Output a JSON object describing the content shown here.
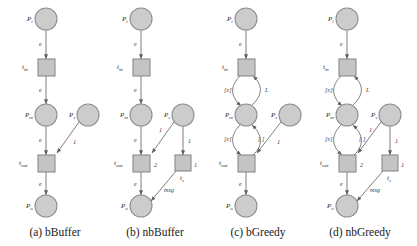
{
  "figure": {
    "width": 417,
    "height": 246,
    "background": "#ffffff",
    "place_fill": "#cccccc",
    "place_stroke": "#8f8f8f",
    "transition_fill": "#c4c4c4",
    "transition_stroke": "#8a8a8a",
    "arc_color": "#6f6f6f"
  },
  "panels": [
    {
      "id": "a",
      "caption": "(a) bBuffer",
      "caption_x": 55,
      "caption_y": 236,
      "places": [
        {
          "name": "place-pi",
          "label": "P",
          "sub": "i",
          "cx": 46,
          "cy": 19,
          "r": 11,
          "label_x": 27,
          "label_y": 21
        },
        {
          "name": "place-pm",
          "label": "P",
          "sub": "m",
          "cx": 46,
          "cy": 115,
          "r": 11,
          "label_x": 25,
          "label_y": 117
        },
        {
          "name": "place-ps",
          "label": "P",
          "sub": "s",
          "cx": 88,
          "cy": 115,
          "r": 11,
          "label_x": 69,
          "label_y": 117
        },
        {
          "name": "place-po",
          "label": "P",
          "sub": "o",
          "cx": 46,
          "cy": 206,
          "r": 11,
          "label_x": 26,
          "label_y": 208
        }
      ],
      "transitions": [
        {
          "name": "transition-tin",
          "label": "t",
          "sub": "in",
          "x": 38,
          "y": 59,
          "w": 17,
          "h": 17,
          "label_x": 22,
          "label_y": 69
        },
        {
          "name": "transition-tout",
          "label": "t",
          "sub": "out",
          "x": 38,
          "y": 155,
          "w": 17,
          "h": 17,
          "label_x": 19,
          "label_y": 165
        }
      ],
      "arcs": [
        {
          "name": "arc-pi-tin",
          "d": "M 46 30 L 46 59",
          "arrow": true,
          "label": "e",
          "label_x": 39,
          "label_y": 46
        },
        {
          "name": "arc-tin-pm",
          "d": "M 46 76 L 46 104",
          "arrow": true,
          "label": "e",
          "label_x": 39,
          "label_y": 92
        },
        {
          "name": "arc-pm-tout",
          "d": "M 46 126 L 46 155",
          "arrow": true,
          "label": "e",
          "label_x": 39,
          "label_y": 142
        },
        {
          "name": "arc-ps-tout",
          "d": "M 79 122 L 57 153",
          "arrow": true,
          "label": "1",
          "label_x": 73,
          "label_y": 144
        },
        {
          "name": "arc-tout-po",
          "d": "M 46 172 L 46 195",
          "arrow": true,
          "label": "e",
          "label_x": 39,
          "label_y": 186
        }
      ]
    },
    {
      "id": "b",
      "caption": "(b) nbBuffer",
      "caption_x": 155,
      "caption_y": 236,
      "places": [
        {
          "name": "place-pi",
          "label": "P",
          "sub": "i",
          "cx": 141,
          "cy": 19,
          "r": 11,
          "label_x": 122,
          "label_y": 21
        },
        {
          "name": "place-pm",
          "label": "P",
          "sub": "m",
          "cx": 141,
          "cy": 115,
          "r": 11,
          "label_x": 120,
          "label_y": 117
        },
        {
          "name": "place-ps",
          "label": "P",
          "sub": "s",
          "cx": 183,
          "cy": 115,
          "r": 11,
          "label_x": 164,
          "label_y": 117
        },
        {
          "name": "place-po",
          "label": "P",
          "sub": "o",
          "cx": 141,
          "cy": 206,
          "r": 11,
          "label_x": 121,
          "label_y": 208
        }
      ],
      "transitions": [
        {
          "name": "transition-tin",
          "label": "t",
          "sub": "in",
          "x": 133,
          "y": 59,
          "w": 17,
          "h": 17,
          "label_x": 117,
          "label_y": 69
        },
        {
          "name": "transition-tout",
          "label": "t",
          "sub": "out",
          "x": 133,
          "y": 155,
          "w": 17,
          "h": 17,
          "label_x": 114,
          "label_y": 165
        },
        {
          "name": "transition-ts",
          "label": "t",
          "sub": "s",
          "x": 175,
          "y": 155,
          "w": 16,
          "h": 16,
          "label_x": 180,
          "label_y": 180
        }
      ],
      "arcs": [
        {
          "name": "arc-pi-tin",
          "d": "M 141 30 L 141 59",
          "arrow": true,
          "label": "e",
          "label_x": 134,
          "label_y": 46
        },
        {
          "name": "arc-tin-pm",
          "d": "M 141 76 L 141 104",
          "arrow": true,
          "label": "e",
          "label_x": 134,
          "label_y": 92
        },
        {
          "name": "arc-pm-tout",
          "d": "M 141 126 L 141 155",
          "arrow": true,
          "label": "e",
          "label_x": 134,
          "label_y": 142
        },
        {
          "name": "arc-ps-tout",
          "d": "M 174 122 L 152 153",
          "arrow": true,
          "label": "1",
          "label_x": 159,
          "label_y": 132
        },
        {
          "name": "arc-ps-ts",
          "d": "M 183 126 L 183 155",
          "arrow": true,
          "label": "1",
          "label_x": 188,
          "label_y": 143
        },
        {
          "name": "arc-tout-po",
          "d": "M 141 172 L 141 195",
          "arrow": true,
          "label": "e",
          "label_x": 134,
          "label_y": 186
        },
        {
          "name": "arc-ts-po",
          "d": "M 176 171 L 151 201",
          "arrow": true,
          "label": "msg",
          "label_x": 164,
          "label_y": 192
        }
      ],
      "weights": [
        {
          "name": "weight-tout",
          "label": "2",
          "x": 154,
          "y": 167
        },
        {
          "name": "weight-ts",
          "label": "1",
          "x": 194,
          "y": 167
        }
      ]
    },
    {
      "id": "c",
      "caption": "(c) bGreedy",
      "caption_x": 258,
      "caption_y": 236,
      "places": [
        {
          "name": "place-pi",
          "label": "P",
          "sub": "i",
          "cx": 246,
          "cy": 19,
          "r": 11,
          "label_x": 227,
          "label_y": 21
        },
        {
          "name": "place-pm",
          "label": "P",
          "sub": "m",
          "cx": 246,
          "cy": 115,
          "r": 11,
          "label_x": 225,
          "label_y": 117
        },
        {
          "name": "place-ps",
          "label": "P",
          "sub": "s",
          "cx": 290,
          "cy": 115,
          "r": 11,
          "label_x": 271,
          "label_y": 117
        },
        {
          "name": "place-po",
          "label": "P",
          "sub": "o",
          "cx": 246,
          "cy": 206,
          "r": 11,
          "label_x": 226,
          "label_y": 208
        }
      ],
      "transitions": [
        {
          "name": "transition-tin",
          "label": "t",
          "sub": "in",
          "x": 238,
          "y": 59,
          "w": 17,
          "h": 17,
          "label_x": 222,
          "label_y": 69
        },
        {
          "name": "transition-tout",
          "label": "t",
          "sub": "out",
          "x": 238,
          "y": 155,
          "w": 17,
          "h": 17,
          "label_x": 219,
          "label_y": 165
        }
      ],
      "arcs": [
        {
          "name": "arc-pi-tin",
          "d": "M 246 30 L 246 59",
          "arrow": true,
          "label": "e",
          "label_x": 239,
          "label_y": 46
        },
        {
          "name": "arc-tin-pm-left",
          "d": "M 240 76 C 230 86 230 96 241 106",
          "arrow": true,
          "label": "[e]",
          "label_x": 224,
          "label_y": 92
        },
        {
          "name": "arc-pm-tin-right",
          "d": "M 252 105 C 263 95 263 85 253 76",
          "arrow": true,
          "label": "L",
          "label_x": 265,
          "label_y": 92
        },
        {
          "name": "arc-pm-tout-left",
          "d": "M 240 125 C 230 135 230 146 241 155",
          "arrow": true,
          "label": "[e]",
          "label_x": 224,
          "label_y": 141
        },
        {
          "name": "arc-tout-pm-right",
          "d": "M 253 155 C 263 146 263 135 252 125",
          "arrow": true,
          "label": "[ ]",
          "label_x": 258,
          "label_y": 141
        },
        {
          "name": "arc-ps-tout",
          "d": "M 281 122 L 257 153",
          "arrow": true,
          "label": "1",
          "label_x": 277,
          "label_y": 144
        },
        {
          "name": "arc-tout-po",
          "d": "M 246 172 L 246 195",
          "arrow": true,
          "label": "e",
          "label_x": 239,
          "label_y": 186
        }
      ]
    },
    {
      "id": "d",
      "caption": "(d) nbGreedy",
      "caption_x": 360,
      "caption_y": 236,
      "places": [
        {
          "name": "place-pi",
          "label": "P",
          "sub": "i",
          "cx": 347,
          "cy": 19,
          "r": 11,
          "label_x": 328,
          "label_y": 21
        },
        {
          "name": "place-pm",
          "label": "P",
          "sub": "m",
          "cx": 347,
          "cy": 115,
          "r": 11,
          "label_x": 326,
          "label_y": 117
        },
        {
          "name": "place-ps",
          "label": "P",
          "sub": "s",
          "cx": 390,
          "cy": 115,
          "r": 11,
          "label_x": 371,
          "label_y": 117
        },
        {
          "name": "place-po",
          "label": "P",
          "sub": "o",
          "cx": 347,
          "cy": 206,
          "r": 11,
          "label_x": 327,
          "label_y": 208
        }
      ],
      "transitions": [
        {
          "name": "transition-tin",
          "label": "t",
          "sub": "in",
          "x": 339,
          "y": 59,
          "w": 17,
          "h": 17,
          "label_x": 323,
          "label_y": 69
        },
        {
          "name": "transition-tout",
          "label": "t",
          "sub": "out",
          "x": 339,
          "y": 155,
          "w": 17,
          "h": 17,
          "label_x": 320,
          "label_y": 165
        },
        {
          "name": "transition-ts",
          "label": "t",
          "sub": "s",
          "x": 382,
          "y": 155,
          "w": 16,
          "h": 16,
          "label_x": 387,
          "label_y": 180
        }
      ],
      "arcs": [
        {
          "name": "arc-pi-tin",
          "d": "M 347 30 L 347 59",
          "arrow": true,
          "label": "e",
          "label_x": 340,
          "label_y": 46
        },
        {
          "name": "arc-tin-pm-left",
          "d": "M 341 76 C 331 86 331 96 342 106",
          "arrow": true,
          "label": "[e]",
          "label_x": 325,
          "label_y": 92
        },
        {
          "name": "arc-pm-tin-right",
          "d": "M 353 105 C 364 95 364 85 354 76",
          "arrow": true,
          "label": "L",
          "label_x": 366,
          "label_y": 92
        },
        {
          "name": "arc-pm-tout-left",
          "d": "M 341 125 C 331 135 331 146 342 155",
          "arrow": true,
          "label": "[e]",
          "label_x": 325,
          "label_y": 141
        },
        {
          "name": "arc-tout-pm-right",
          "d": "M 354 155 C 364 146 364 135 353 125",
          "arrow": true,
          "label": "[ ]",
          "label_x": 359,
          "label_y": 141
        },
        {
          "name": "arc-ps-tout",
          "d": "M 381 122 L 358 153",
          "arrow": true,
          "label": "1",
          "label_x": 369,
          "label_y": 132
        },
        {
          "name": "arc-ps-ts",
          "d": "M 390 126 L 390 155",
          "arrow": true,
          "label": "1",
          "label_x": 395,
          "label_y": 143
        },
        {
          "name": "arc-tout-po",
          "d": "M 347 172 L 347 195",
          "arrow": true,
          "label": "e",
          "label_x": 340,
          "label_y": 186
        },
        {
          "name": "arc-ts-po",
          "d": "M 383 171 L 357 201",
          "arrow": true,
          "label": "msg",
          "label_x": 370,
          "label_y": 192
        }
      ],
      "weights": [
        {
          "name": "weight-tout",
          "label": "2",
          "x": 360,
          "y": 167
        },
        {
          "name": "weight-ts",
          "label": "1",
          "x": 401,
          "y": 167
        }
      ]
    }
  ]
}
